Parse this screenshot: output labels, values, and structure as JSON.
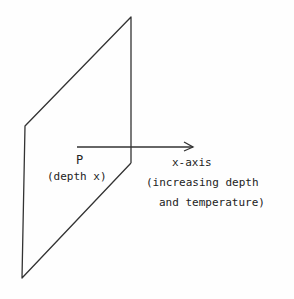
{
  "diagram": {
    "plane": {
      "top": [
        131,
        17
      ],
      "left_top": [
        25,
        126
      ],
      "left_bottom": [
        22,
        278
      ],
      "right_bottom": [
        131,
        163
      ],
      "stroke": "#333333"
    },
    "arrow": {
      "x1": 77,
      "y1": 147,
      "x2": 193,
      "y2": 147,
      "stroke": "#333333"
    },
    "labels": {
      "point": "P",
      "point_depth": "(depth x)",
      "axis": "x-axis",
      "axis_desc_line1": "(increasing depth",
      "axis_desc_line2": "and temperature)"
    }
  }
}
